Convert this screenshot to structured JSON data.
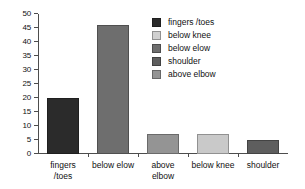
{
  "chart_data": {
    "type": "bar",
    "title": "",
    "xlabel": "",
    "ylabel": "",
    "categories": [
      "fingers /toes",
      "below elow",
      "above elbow",
      "below knee",
      "shoulder"
    ],
    "values": [
      20,
      46,
      7,
      7,
      5
    ],
    "bar_colors": [
      "#2b2b2b",
      "#6e6e6e",
      "#949494",
      "#c9c9c9",
      "#5e5e5e"
    ],
    "ylim": [
      0,
      50
    ],
    "yticks": [
      0,
      5,
      10,
      15,
      20,
      25,
      30,
      35,
      40,
      45,
      50
    ],
    "ytick_labels": [
      "0",
      "5",
      "10",
      "15",
      "20",
      "25",
      "30",
      "35",
      "40",
      "45",
      "50"
    ],
    "grid": false,
    "legend_position": "upper right",
    "series": [
      {
        "name": "amputation level",
        "values": [
          20,
          46,
          7,
          7,
          5
        ]
      }
    ],
    "legend": [
      {
        "label": "fingers /toes",
        "color": "#2b2b2b"
      },
      {
        "label": "below knee",
        "color": "#d0d0d0"
      },
      {
        "label": "below elow",
        "color": "#6e6e6e"
      },
      {
        "label": "shoulder",
        "color": "#5e5e5e"
      },
      {
        "label": "above elbow",
        "color": "#949494"
      }
    ],
    "xtick_labels": [
      {
        "line1": "fingers",
        "line2": "/toes"
      },
      {
        "line1": "below elow",
        "line2": ""
      },
      {
        "line1": "above",
        "line2": "elbow"
      },
      {
        "line1": "below knee",
        "line2": ""
      },
      {
        "line1": "shoulder",
        "line2": ""
      }
    ]
  },
  "axes": {
    "axis_color": "#4d4d4d"
  }
}
